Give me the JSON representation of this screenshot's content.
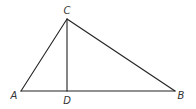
{
  "diagram": {
    "type": "triangle-with-altitude",
    "colors": {
      "line": "#222222",
      "label": "#333333",
      "background": "#ffffff"
    },
    "points": {
      "A": {
        "label": "A",
        "x": 21,
        "y": 91,
        "label_x": 14,
        "label_y": 99
      },
      "B": {
        "label": "B",
        "x": 175,
        "y": 91,
        "label_x": 181,
        "label_y": 99
      },
      "C": {
        "label": "C",
        "x": 67,
        "y": 19,
        "label_x": 67,
        "label_y": 14
      },
      "D": {
        "label": "D",
        "x": 67,
        "y": 91,
        "label_x": 67,
        "label_y": 104
      }
    },
    "segments": [
      {
        "from": "A",
        "to": "C"
      },
      {
        "from": "C",
        "to": "B"
      },
      {
        "from": "A",
        "to": "B"
      },
      {
        "from": "C",
        "to": "D"
      }
    ]
  }
}
